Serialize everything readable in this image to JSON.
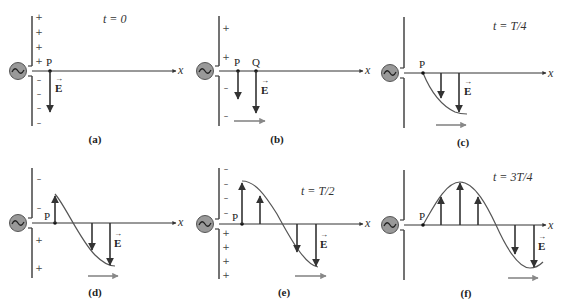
{
  "figure": {
    "colors": {
      "line": "#333333",
      "arrow": "#333333",
      "wave_curve": "#555555",
      "propagation_arrow": "#888888",
      "generator_fill": "#999999"
    },
    "panels": [
      {
        "id": "a",
        "caption": "(a)",
        "time": "t = 0",
        "points": [
          "P"
        ],
        "axis_label": "x",
        "field_label": "E",
        "charges_top": [
          "+",
          "+",
          "+",
          "+"
        ],
        "charges_bottom": [
          "–",
          "–",
          "–",
          "–"
        ]
      },
      {
        "id": "b",
        "caption": "(b)",
        "time": "",
        "points": [
          "P",
          "Q"
        ],
        "axis_label": "x",
        "field_label": "E",
        "charges_top": [
          "+",
          "+"
        ],
        "charges_bottom": [
          "–",
          "–"
        ]
      },
      {
        "id": "c",
        "caption": "(c)",
        "time": "t = T/4",
        "points": [
          "P"
        ],
        "axis_label": "x",
        "field_label": "E",
        "charges_top": [],
        "charges_bottom": []
      },
      {
        "id": "d",
        "caption": "(d)",
        "time": "",
        "points": [
          "P"
        ],
        "axis_label": "x",
        "field_label": "E",
        "charges_top": [
          "–",
          "–"
        ],
        "charges_bottom": [
          "+",
          "+"
        ]
      },
      {
        "id": "e",
        "caption": "(e)",
        "time": "t = T/2",
        "points": [
          "P"
        ],
        "axis_label": "x",
        "field_label": "E",
        "charges_top": [
          "–",
          "–",
          "–",
          "–"
        ],
        "charges_bottom": [
          "+",
          "+",
          "+",
          "+"
        ]
      },
      {
        "id": "f",
        "caption": "(f)",
        "time": "t = 3T/4",
        "points": [
          "P"
        ],
        "axis_label": "x",
        "field_label": "E",
        "charges_top": [],
        "charges_bottom": []
      }
    ]
  }
}
